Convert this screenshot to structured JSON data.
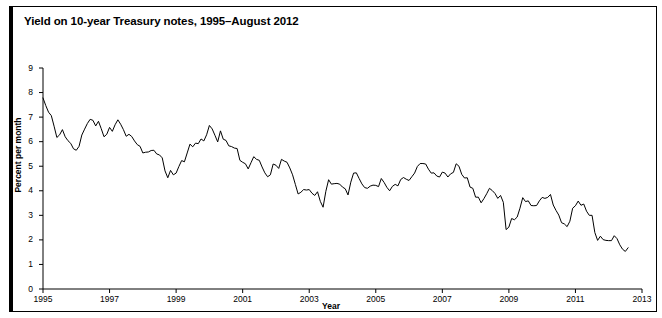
{
  "figure": {
    "title": "Yield on 10-year Treasury notes, 1995–August 2012"
  },
  "chart_data": {
    "type": "line",
    "title": "Yield on 10-year Treasury notes, 1995–August 2012",
    "xlabel": "Year",
    "ylabel": "Percent per month",
    "xlim": [
      1995,
      2013
    ],
    "ylim": [
      0,
      9
    ],
    "grid": false,
    "legend": null,
    "x_ticks": [
      "1995",
      "1997",
      "1999",
      "2001",
      "2003",
      "2005",
      "2007",
      "2009",
      "2011",
      "2013"
    ],
    "x_tick_values": [
      1995,
      1997,
      1999,
      2001,
      2003,
      2005,
      2007,
      2009,
      2011,
      2013
    ],
    "y_ticks": [
      "0",
      "1",
      "2",
      "3",
      "4",
      "5",
      "6",
      "7",
      "8",
      "9"
    ],
    "y_tick_values": [
      0,
      1,
      2,
      3,
      4,
      5,
      6,
      7,
      8,
      9
    ],
    "line_color": "#000000",
    "series": [
      {
        "name": "10-year Treasury note yield",
        "x_start": 1995.0,
        "x_step": 0.08333,
        "units": "percent per month",
        "values": [
          7.78,
          7.47,
          7.2,
          7.06,
          6.63,
          6.17,
          6.28,
          6.49,
          6.2,
          6.04,
          5.93,
          5.71,
          5.65,
          5.81,
          6.27,
          6.51,
          6.74,
          6.91,
          6.87,
          6.64,
          6.83,
          6.53,
          6.2,
          6.3,
          6.58,
          6.42,
          6.69,
          6.89,
          6.71,
          6.49,
          6.22,
          6.3,
          6.21,
          6.03,
          5.88,
          5.81,
          5.54,
          5.57,
          5.58,
          5.64,
          5.65,
          5.5,
          5.46,
          5.34,
          4.81,
          4.53,
          4.83,
          4.65,
          4.72,
          4.99,
          5.23,
          5.18,
          5.54,
          5.9,
          5.79,
          5.94,
          5.92,
          6.11,
          6.03,
          6.28,
          6.66,
          6.52,
          6.26,
          5.99,
          6.44,
          6.1,
          6.05,
          5.83,
          5.8,
          5.74,
          5.72,
          5.24,
          5.16,
          5.1,
          4.89,
          5.14,
          5.39,
          5.28,
          5.24,
          4.97,
          4.73,
          4.57,
          4.65,
          5.09,
          5.04,
          4.91,
          5.28,
          5.21,
          5.16,
          4.93,
          4.65,
          4.26,
          3.87,
          3.94,
          4.05,
          4.03,
          4.05,
          3.9,
          3.81,
          3.96,
          3.57,
          3.33,
          3.98,
          4.45,
          4.27,
          4.29,
          4.3,
          4.27,
          4.15,
          4.08,
          3.83,
          4.35,
          4.72,
          4.73,
          4.5,
          4.28,
          4.13,
          4.1,
          4.19,
          4.23,
          4.22,
          4.17,
          4.5,
          4.34,
          4.14,
          4.0,
          4.18,
          4.26,
          4.2,
          4.46,
          4.54,
          4.47,
          4.42,
          4.57,
          4.72,
          4.99,
          5.11,
          5.11,
          5.09,
          4.88,
          4.72,
          4.73,
          4.6,
          4.56,
          4.76,
          4.72,
          4.56,
          4.69,
          4.75,
          5.1,
          5.0,
          4.67,
          4.52,
          4.53,
          4.15,
          4.1,
          3.74,
          3.74,
          3.51,
          3.68,
          3.88,
          4.1,
          4.01,
          3.89,
          3.69,
          3.81,
          3.53,
          2.42,
          2.52,
          2.87,
          2.82,
          2.93,
          3.29,
          3.72,
          3.56,
          3.59,
          3.4,
          3.39,
          3.4,
          3.59,
          3.73,
          3.69,
          3.73,
          3.85,
          3.42,
          3.2,
          3.01,
          2.7,
          2.65,
          2.54,
          2.76,
          3.29,
          3.39,
          3.58,
          3.41,
          3.46,
          3.17,
          3.0,
          3.0,
          2.3,
          1.98,
          2.15,
          2.01,
          1.98,
          1.97,
          1.97,
          2.17,
          2.05,
          1.8,
          1.62,
          1.53,
          1.68
        ]
      }
    ]
  }
}
